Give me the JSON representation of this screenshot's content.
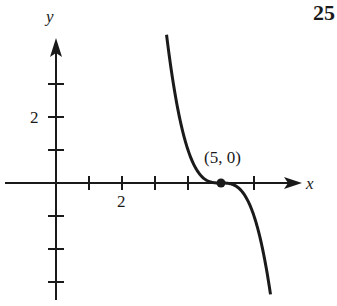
{
  "problem_number": "25",
  "chart_data": {
    "type": "line",
    "title": "",
    "xlabel": "x",
    "ylabel": "y",
    "function": "y = -(x - 5)^3",
    "xlim": [
      -1.7,
      8.5
    ],
    "ylim": [
      -3.6,
      5
    ],
    "x_ticks": [
      1,
      2,
      3,
      4,
      6
    ],
    "y_ticks": [
      -3,
      -2,
      -1,
      1,
      2,
      3
    ],
    "x_tick_labels": [
      {
        "value": 2,
        "label": "2"
      }
    ],
    "y_tick_labels": [
      {
        "value": 2,
        "label": "2"
      }
    ],
    "curve_domain": [
      3.35,
      6.5
    ],
    "points": [
      {
        "x": 5,
        "y": 0,
        "label": "(5, 0)"
      }
    ],
    "grid": false,
    "legend": null
  }
}
